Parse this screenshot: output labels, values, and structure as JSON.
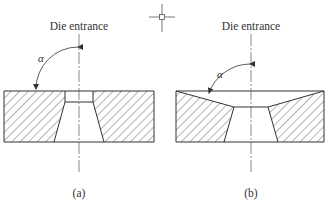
{
  "figure": {
    "crosshair_icon": "crosshair-cursor-icon",
    "panels": [
      {
        "id": "a",
        "title": "Die entrance",
        "angle_symbol": "α",
        "caption": "(a)"
      },
      {
        "id": "b",
        "title": "Die entrance",
        "angle_symbol": "α",
        "caption": "(b)"
      }
    ]
  }
}
